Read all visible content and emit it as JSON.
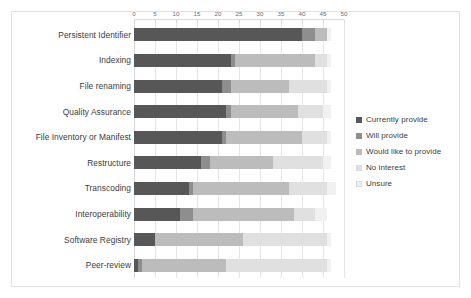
{
  "figure": {
    "top_clipped_text": "...  ..        .                    .",
    "background": "#ffffff",
    "border_color": "#e2e2e6"
  },
  "chart_data": {
    "type": "bar",
    "orientation": "horizontal",
    "stacked": true,
    "title": "",
    "subtitle": "",
    "xlabel": "",
    "ylabel": "",
    "xlim": [
      0,
      50
    ],
    "ylim": null,
    "grid": true,
    "grid_axis": "x",
    "legend_position": "right",
    "xticks": [
      0,
      5,
      10,
      15,
      20,
      25,
      30,
      35,
      40,
      45,
      50
    ],
    "xticklabels": [
      "0",
      "5",
      "10",
      "15",
      "20",
      "25",
      "30",
      "35",
      "40",
      "45",
      "50"
    ],
    "categories": [
      "Persistent Identifier",
      "Indexing",
      "File renaming",
      "Quality Assurance",
      "File Inventory or Manifest",
      "Restructure",
      "Transcoding",
      "Interoperability",
      "Software Registry",
      "Peer-review"
    ],
    "series": [
      {
        "name": "Currently provide",
        "color": "#575757",
        "values": [
          40,
          23,
          21,
          22,
          21,
          16,
          13,
          11,
          5,
          1
        ]
      },
      {
        "name": "Will provide",
        "color": "#8e8e8e",
        "values": [
          3,
          1,
          2,
          1,
          1,
          2,
          1,
          3,
          0,
          1
        ]
      },
      {
        "name": "Would like to provide",
        "color": "#bcbcbc",
        "values": [
          3,
          19,
          14,
          16,
          18,
          15,
          23,
          24,
          21,
          20
        ]
      },
      {
        "name": "No interest",
        "color": "#e0e0e0",
        "values": [
          0,
          3,
          9,
          6,
          6,
          12,
          9,
          5,
          20,
          24
        ]
      },
      {
        "name": "Unsure",
        "color": "#f1f1f1",
        "values": [
          1,
          1,
          1,
          2,
          1,
          2,
          2,
          3,
          1,
          1
        ]
      }
    ]
  },
  "legend": {
    "items": [
      {
        "label": "Currently provide",
        "color": "#575757"
      },
      {
        "label": "Will provide",
        "color": "#8e8e8e"
      },
      {
        "label": "Would like to provide",
        "color": "#bcbcbc"
      },
      {
        "label": "No interest",
        "color": "#e0e0e0"
      },
      {
        "label": "Unsure",
        "color": "#f1f1f1"
      }
    ]
  }
}
